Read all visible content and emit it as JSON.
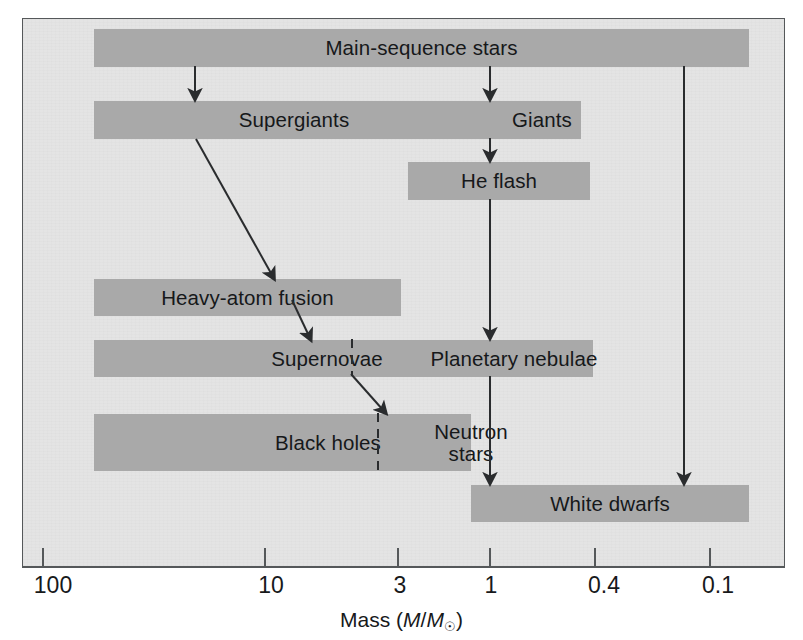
{
  "figure": {
    "background_color": "#e4e4e4",
    "bar_color": "#a9a9a9",
    "line_color": "#2a2c2e",
    "frame_color": "#55585a"
  },
  "axis": {
    "label_text": "Mass (",
    "label_italic_m": "M",
    "label_slash": "/",
    "label_italic_m2": "M",
    "label_sun": "☉",
    "label_close": ")",
    "label_plain": "Mass (M/M☉)",
    "scale": "log-reversed",
    "ticks": [
      {
        "value": "100",
        "x": 43
      },
      {
        "value": "10",
        "x": 265
      },
      {
        "value": "3",
        "x": 398
      },
      {
        "value": "1",
        "x": 490
      },
      {
        "value": "0.4",
        "x": 595
      },
      {
        "value": "0.1",
        "x": 710
      }
    ]
  },
  "stages": [
    {
      "id": "main-sequence-stars",
      "label": "Main-sequence stars",
      "x": 93,
      "y": 28,
      "w": 655,
      "h": 38,
      "align": "center"
    },
    {
      "id": "supergiants",
      "label": "Supergiants",
      "x": 93,
      "y": 100,
      "w": 487,
      "h": 38,
      "align": "slot",
      "slot_center": 200
    },
    {
      "id": "giants",
      "label": "Giants",
      "slot_center": 490
    },
    {
      "id": "he-flash",
      "label": "He flash",
      "x": 407,
      "y": 161,
      "w": 182,
      "h": 38,
      "align": "center"
    },
    {
      "id": "heavy-atom-fusion",
      "label": "Heavy-atom fusion",
      "x": 93,
      "y": 278,
      "w": 307,
      "h": 37,
      "align": "center"
    },
    {
      "id": "supernovae",
      "label": "Supernovae",
      "x": 93,
      "y": 339,
      "w": 499,
      "h": 37,
      "align": "slot",
      "slot_center": 244
    },
    {
      "id": "planetary-nebulae",
      "label": "Planetary nebulae",
      "slot_center": 470
    },
    {
      "id": "black-holes",
      "label": "Black holes",
      "x": 93,
      "y": 413,
      "w": 377,
      "h": 57,
      "align": "slot",
      "slot_center": 234
    },
    {
      "id": "neutron-stars",
      "label_line1": "Neutron",
      "label_line2": "stars",
      "slot_center": 424
    },
    {
      "id": "white-dwarfs",
      "label": "White dwarfs",
      "x": 470,
      "y": 484,
      "w": 278,
      "h": 37,
      "align": "center"
    }
  ],
  "dividers": [
    {
      "id": "supernovae-planetary-divider",
      "x": 352,
      "y1": 339,
      "y2": 376
    },
    {
      "id": "blackhole-neutron-divider",
      "x": 378,
      "y1": 413,
      "y2": 470
    }
  ],
  "connectors": [
    {
      "id": "ms-to-supergiants",
      "from": "main-sequence-stars",
      "to": "supergiants",
      "kind": "arrow-vertical"
    },
    {
      "id": "ms-to-giants",
      "from": "main-sequence-stars",
      "to": "giants",
      "kind": "arrow-vertical"
    },
    {
      "id": "ms-to-white-dwarfs",
      "from": "main-sequence-stars",
      "to": "white-dwarfs",
      "kind": "arrow-vertical-long"
    },
    {
      "id": "giants-to-he-flash",
      "from": "giants",
      "to": "he-flash",
      "kind": "arrow-vertical"
    },
    {
      "id": "he-flash-to-planetary",
      "from": "he-flash",
      "to": "planetary-nebulae",
      "kind": "arrow-vertical-long"
    },
    {
      "id": "planetary-to-white-dwarfs",
      "from": "planetary-nebulae",
      "to": "white-dwarfs",
      "kind": "arrow-vertical-long"
    },
    {
      "id": "supergiants-to-heavy-atom",
      "from": "supergiants",
      "to": "heavy-atom-fusion",
      "kind": "arrow-diagonal"
    },
    {
      "id": "heavy-atom-to-supernovae",
      "from": "heavy-atom-fusion",
      "to": "supernovae",
      "kind": "arrow-diagonal"
    },
    {
      "id": "supernovae-to-neutron",
      "from": "supernovae",
      "to": "neutron-stars",
      "kind": "arrow-diagonal"
    }
  ]
}
